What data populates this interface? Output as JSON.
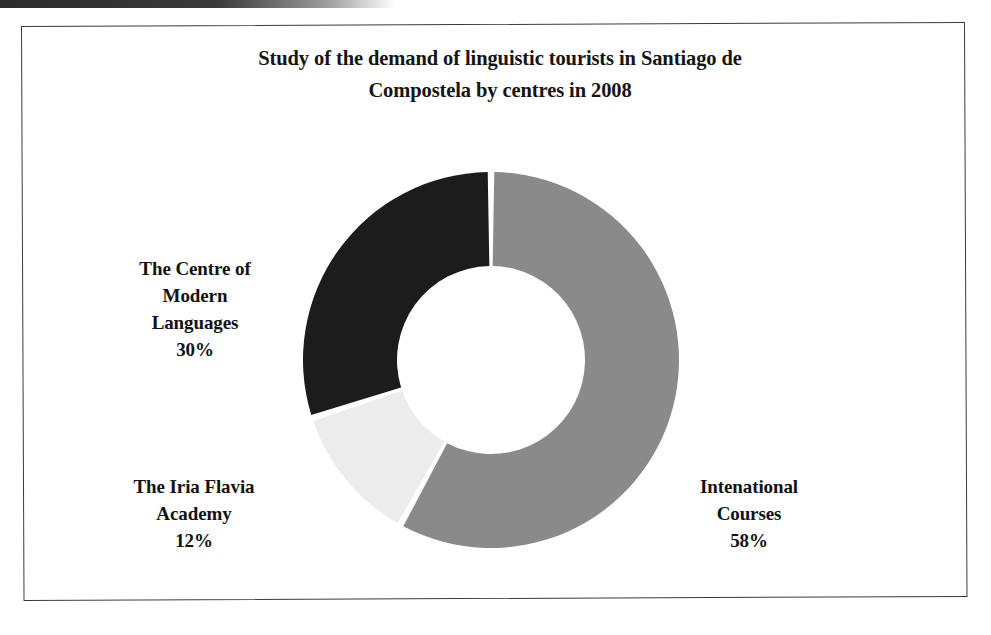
{
  "chart_data": {
    "type": "pie",
    "variant": "donut",
    "title": "Study of the demand of linguistic tourists in Santiago de Compostela by centres in 2008",
    "title_lines": [
      "Study of the demand of linguistic tourists in Santiago de",
      "Compostela by centres in 2008"
    ],
    "xlabel": "",
    "ylabel": "",
    "units": "percent",
    "total": 100,
    "legend": "none",
    "grid": false,
    "labels_inline": true,
    "start_angle_deg": 0,
    "direction": "clockwise",
    "inner_radius_ratio": 0.5,
    "categories": [
      "Intenational Courses",
      "The Iria Flavia Academy",
      "The Centre of Modern Languages"
    ],
    "values": [
      58,
      12,
      30
    ],
    "slices": [
      {
        "name": "Intenational Courses",
        "value": 58,
        "value_label": "58%",
        "color": "#8a8a8a",
        "label_lines": [
          "Intenational",
          "Courses"
        ]
      },
      {
        "name": "The Iria Flavia Academy",
        "value": 12,
        "value_label": "12%",
        "color": "#ececec",
        "label_lines": [
          "The Iria Flavia",
          "Academy"
        ]
      },
      {
        "name": "The Centre of Modern Languages",
        "value": 30,
        "value_label": "30%",
        "color": "#1c1c1c",
        "label_lines": [
          "The Centre of",
          "Modern",
          "Languages"
        ]
      }
    ]
  },
  "frame": {
    "border_color": "#3c3c3c"
  },
  "labels": {
    "modern_languages": {
      "line1": "The Centre of",
      "line2": "Modern",
      "line3": "Languages",
      "value": "30%"
    },
    "iria_flavia": {
      "line1": "The Iria Flavia",
      "line2": "Academy",
      "value": "12%"
    },
    "international_courses": {
      "line1": "Intenational",
      "line2": "Courses",
      "value": "58%"
    }
  },
  "title": {
    "line1": "Study of the demand of linguistic tourists in Santiago de",
    "line2": "Compostela by centres in 2008"
  }
}
